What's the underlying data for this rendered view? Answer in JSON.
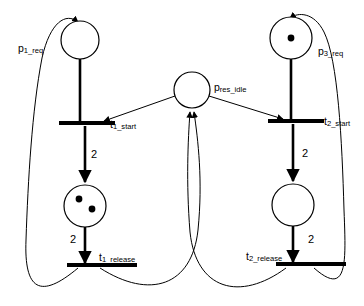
{
  "diagram": {
    "type": "petri-net",
    "colors": {
      "stroke": "#000000",
      "fill": "#ffffff",
      "token": "#000000"
    },
    "places": [
      {
        "id": "p1_req",
        "label_main": "p",
        "label_sub": "1_req",
        "tokens": 0,
        "cx": 80,
        "cy": 40,
        "r": 19
      },
      {
        "id": "p_res_idle",
        "label_main": "p",
        "label_sub": "res_idle",
        "tokens": 0,
        "cx": 192,
        "cy": 90,
        "r": 18
      },
      {
        "id": "p3_req",
        "label_main": "p",
        "label_sub": "3_req",
        "tokens": 1,
        "cx": 291,
        "cy": 38,
        "r": 21
      },
      {
        "id": "p2_use",
        "label_main": "",
        "label_sub": "",
        "tokens": 2,
        "cx": 85,
        "cy": 206,
        "r": 21
      },
      {
        "id": "p4_use",
        "label_main": "",
        "label_sub": "",
        "tokens": 0,
        "cx": 293,
        "cy": 205,
        "r": 21
      }
    ],
    "transitions": [
      {
        "id": "t1_start",
        "label_main": "t",
        "label_sub": "1_start",
        "x": 59,
        "y": 123,
        "width": 56
      },
      {
        "id": "t2_start",
        "label_main": "t",
        "label_sub": "2_start",
        "x": 268,
        "y": 121,
        "width": 56
      },
      {
        "id": "t1_release",
        "label_main": "t",
        "label_sub": "1_release",
        "x": 67,
        "y": 265,
        "width": 70
      },
      {
        "id": "t2_release",
        "label_main": "t",
        "label_sub": "2_release",
        "x": 276,
        "y": 264,
        "width": 70
      }
    ],
    "arc_weights": [
      {
        "id": "w-t1start-p2use",
        "value": "2",
        "x": 94,
        "y": 155
      },
      {
        "id": "w-p2use-t1release",
        "value": "2",
        "x": 73,
        "y": 240
      },
      {
        "id": "w-t2start-p4use",
        "value": "2",
        "x": 305,
        "y": 154
      },
      {
        "id": "w-p4use-t2release",
        "value": "2",
        "x": 311,
        "y": 240
      }
    ]
  }
}
